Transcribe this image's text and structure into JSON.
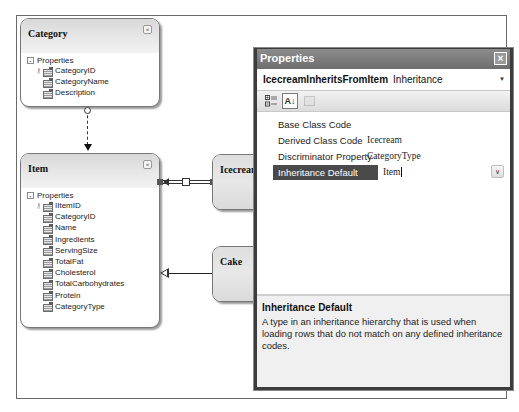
{
  "diagram": {
    "entities": [
      {
        "name": "Category",
        "section_label": "Properties",
        "properties": [
          "CategoryID",
          "CategoryName",
          "Description"
        ],
        "key_property": "CategoryID"
      },
      {
        "name": "Item",
        "section_label": "Properties",
        "properties": [
          "IItemID",
          "CategoryID",
          "Name",
          "Ingredients",
          "ServingSize",
          "TotalFat",
          "Cholesterol",
          "TotalCarbohydrates",
          "Protein",
          "CategoryType"
        ],
        "key_property": "IItemID"
      },
      {
        "name": "Icecream"
      },
      {
        "name": "Cake"
      }
    ],
    "collapse_glyph": "«"
  },
  "properties_window": {
    "title": "Properties",
    "close_glyph": "×",
    "object": {
      "name": "IcecreamInheritsFromItem",
      "type": "Inheritance"
    },
    "dropdown_glyph": "▼",
    "toolbar": {
      "categorized_icon": "categorized-icon",
      "alphabetical_label": "A↓",
      "property_pages_icon": "property-pages-icon"
    },
    "rows": [
      {
        "name": "Base Class Code",
        "value": ""
      },
      {
        "name": "Derived Class Code",
        "value": "Icecream"
      },
      {
        "name": "Discriminator Property",
        "value": "CategoryType"
      },
      {
        "name": "Inheritance Default",
        "value": "Item",
        "selected": true
      }
    ],
    "row_dropdown_glyph": "∨",
    "description": {
      "title": "Inheritance Default",
      "text": "A type in an inheritance hierarchy that is used when loading rows that do not match on any defined inheritance codes."
    }
  }
}
